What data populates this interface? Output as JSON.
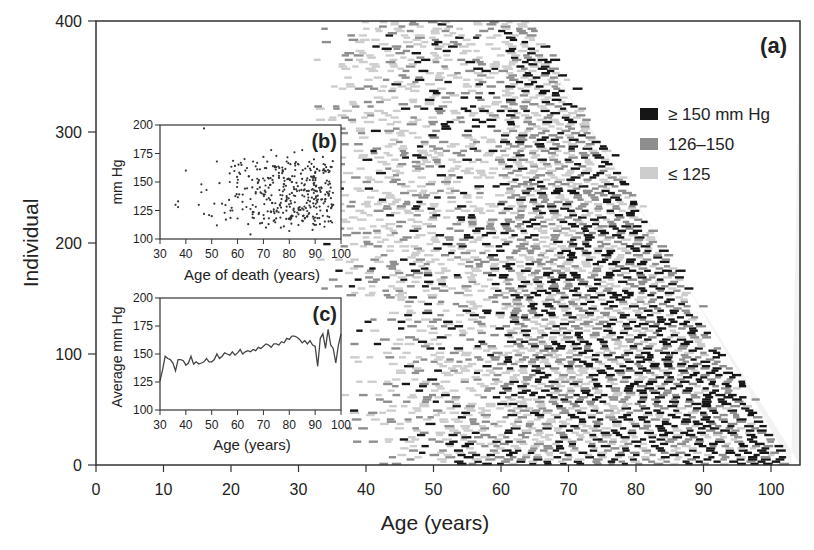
{
  "chart_data": [
    {
      "panel": "(a)",
      "type": "heatmap",
      "title": "",
      "xlabel": "Age (years)",
      "ylabel": "Individual",
      "xlim": [
        0,
        104
      ],
      "ylim": [
        0,
        400
      ],
      "xticks": [
        0,
        10,
        20,
        30,
        40,
        50,
        60,
        70,
        80,
        90,
        100
      ],
      "yticks": [
        0,
        100,
        200,
        300,
        400
      ],
      "grid": false,
      "legend_position": "upper right",
      "legend": [
        {
          "label": "≥ 150 mm Hg",
          "color": "#111111"
        },
        {
          "label": "126–150",
          "color": "#8c8c8c"
        },
        {
          "label": "≤ 125",
          "color": "#cfcfcf"
        }
      ],
      "description": "Each row is one individual (400 total), sorted by age of death (older at bottom). Horizontal dashes mark blood pressure measurements at given ages, shaded by category. Earliest measurements around age 32–45; oldest individuals reach ~102 years.",
      "row_span": {
        "individual_0_age_of_death": 102,
        "individual_400_age_of_death": 64,
        "first_measurement_age_min": 32
      }
    },
    {
      "panel": "(b)",
      "type": "scatter",
      "title": "",
      "xlabel": "Age of death (years)",
      "ylabel": "mm Hg",
      "xlim": [
        30,
        100
      ],
      "ylim": [
        100,
        200
      ],
      "xticks": [
        30,
        40,
        50,
        60,
        70,
        80,
        90,
        100
      ],
      "yticks": [
        100,
        125,
        150,
        175,
        200
      ],
      "points_summary": "~400 points; most between ages 60–95 and 110–175 mm Hg; outlier near (47,197)",
      "sample_points": [
        [
          36,
          130
        ],
        [
          37,
          128
        ],
        [
          37,
          133
        ],
        [
          40,
          160
        ],
        [
          45,
          130
        ],
        [
          46,
          148
        ],
        [
          46,
          141
        ],
        [
          47,
          197
        ],
        [
          47,
          122
        ],
        [
          48,
          143
        ],
        [
          49,
          121
        ],
        [
          50,
          120
        ],
        [
          51,
          131
        ],
        [
          52,
          168
        ],
        [
          52,
          112
        ],
        [
          53,
          149
        ],
        [
          54,
          131
        ],
        [
          55,
          123
        ],
        [
          57,
          150
        ],
        [
          58,
          125
        ],
        [
          60,
          118
        ],
        [
          61,
          157
        ],
        [
          62,
          139
        ],
        [
          63,
          160
        ],
        [
          65,
          104
        ],
        [
          65,
          135
        ],
        [
          66,
          168
        ],
        [
          67,
          140
        ],
        [
          68,
          150
        ],
        [
          70,
          172
        ],
        [
          71,
          110
        ],
        [
          72,
          145
        ],
        [
          73,
          178
        ],
        [
          74,
          126
        ],
        [
          75,
          173
        ],
        [
          76,
          158
        ],
        [
          77,
          135
        ],
        [
          78,
          148
        ],
        [
          79,
          168
        ],
        [
          80,
          107
        ],
        [
          81,
          150
        ],
        [
          82,
          176
        ],
        [
          83,
          142
        ],
        [
          84,
          128
        ],
        [
          85,
          178
        ],
        [
          86,
          148
        ],
        [
          87,
          120
        ],
        [
          88,
          133
        ],
        [
          89,
          108
        ],
        [
          90,
          158
        ],
        [
          91,
          138
        ],
        [
          92,
          125
        ],
        [
          93,
          172
        ],
        [
          94,
          149
        ],
        [
          95,
          140
        ],
        [
          96,
          145
        ],
        [
          97,
          130
        ]
      ]
    },
    {
      "panel": "(c)",
      "type": "line",
      "title": "",
      "xlabel": "Age (years)",
      "ylabel": "Average mm Hg",
      "xlim": [
        30,
        100
      ],
      "ylim": [
        100,
        200
      ],
      "xticks": [
        30,
        40,
        50,
        60,
        70,
        80,
        90,
        100
      ],
      "yticks": [
        100,
        125,
        150,
        175,
        200
      ],
      "x": [
        30,
        31,
        32,
        33,
        34,
        35,
        36,
        37,
        38,
        39,
        40,
        41,
        42,
        43,
        44,
        45,
        46,
        47,
        48,
        49,
        50,
        51,
        52,
        53,
        54,
        55,
        56,
        57,
        58,
        59,
        60,
        61,
        62,
        63,
        64,
        65,
        66,
        67,
        68,
        69,
        70,
        71,
        72,
        73,
        74,
        75,
        76,
        77,
        78,
        79,
        80,
        81,
        82,
        83,
        84,
        85,
        86,
        87,
        88,
        89,
        90,
        91,
        92,
        93,
        94,
        95,
        96,
        97,
        98,
        99,
        100
      ],
      "y": [
        126,
        136,
        148,
        146,
        145,
        142,
        135,
        145,
        145,
        144,
        140,
        142,
        148,
        141,
        143,
        141,
        142,
        143,
        146,
        143,
        143,
        145,
        150,
        146,
        148,
        151,
        150,
        149,
        152,
        149,
        151,
        154,
        150,
        152,
        153,
        152,
        154,
        153,
        156,
        155,
        157,
        159,
        158,
        156,
        159,
        159,
        158,
        161,
        160,
        164,
        163,
        166,
        166,
        165,
        163,
        160,
        162,
        159,
        162,
        158,
        157,
        139,
        164,
        168,
        155,
        172,
        158,
        155,
        142,
        158,
        168
      ]
    }
  ],
  "panel_labels": {
    "a": "(a)",
    "b": "(b)",
    "c": "(c)"
  },
  "axes": {
    "main_xlabel": "Age (years)",
    "main_ylabel": "Individual",
    "b_xlabel": "Age of death (years)",
    "b_ylabel": "mm Hg",
    "c_xlabel": "Age (years)",
    "c_ylabel": "Average mm Hg"
  },
  "legend": {
    "high": "≥ 150 mm Hg",
    "mid": "126–150",
    "low": "≤ 125"
  },
  "colors": {
    "high": "#161616",
    "mid": "#8e8e8e",
    "low": "#cdcdcd",
    "axis": "#333333"
  }
}
